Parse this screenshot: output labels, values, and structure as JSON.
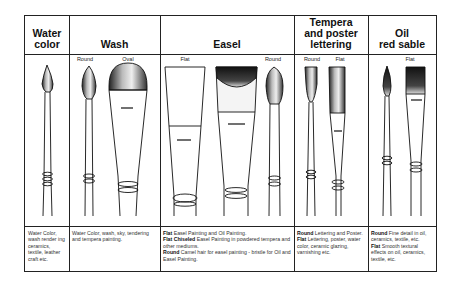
{
  "columns": [
    {
      "title": "Water\ncolor",
      "title_lines": [
        "Water",
        "color"
      ],
      "brushes": [],
      "description": [
        {
          "text": "Water Color, wash render ing ceramics, textile, leather craft etc."
        }
      ]
    },
    {
      "title": "Wash",
      "title_lines": [
        "Wash"
      ],
      "brushes": [
        "Round",
        "Oval"
      ],
      "description": [
        {
          "text": "Water Color, wash, sky, tendering and tempera painting."
        }
      ]
    },
    {
      "title": "Easel",
      "title_lines": [
        "Easel"
      ],
      "brushes": [
        "Flat",
        "Round"
      ],
      "description": [
        {
          "bold": "Flat",
          "text": " Easel Painting and Oil Painting."
        },
        {
          "bold": "Flat Chiseled",
          "text": " Easel Painting in powdered tempera and other mediums."
        },
        {
          "bold": "Round",
          "text": " Camel hair for easel painting - bristle for Oil and Easel Painting."
        }
      ]
    },
    {
      "title": "Tempera and poster lettering",
      "title_lines": [
        "Tempera",
        "and poster",
        "lettering"
      ],
      "brushes": [
        "Round",
        "Flat"
      ],
      "description": [
        {
          "bold": "Round",
          "text": " Lettering and Poster."
        },
        {
          "bold": "Flat",
          "text": " Lettering, poster, water color, ceramic glazing, varnishing etc."
        }
      ]
    },
    {
      "title": "Oil red sable",
      "title_lines": [
        "Oil",
        "red sable"
      ],
      "brushes": [
        "Flat"
      ],
      "description": [
        {
          "bold": "Round",
          "text": " Fine detail in oil, ceramics, textile, etc."
        },
        {
          "bold": "Flat",
          "text": " Smooth textural effects on oil, ceramics, textile, etc."
        }
      ]
    }
  ]
}
